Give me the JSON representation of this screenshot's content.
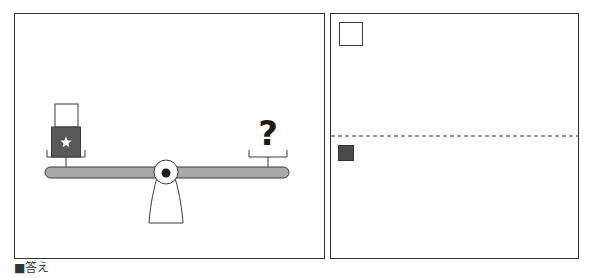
{
  "answer_label": "■答え",
  "colors": {
    "frame": "#333333",
    "dark_block": "#595959",
    "beam": "#a8a8a8",
    "stroke": "#3a3a3a",
    "square_dark": "#4a4a4a"
  },
  "scale": {
    "left_pan": {
      "items": [
        "white-block",
        "dark-block-with-star"
      ]
    },
    "right_pan": {
      "items": [
        "question-mark"
      ],
      "symbol": "?"
    }
  },
  "answer_panel": {
    "top_section_marker": "white-square",
    "bottom_section_marker": "dark-square"
  }
}
